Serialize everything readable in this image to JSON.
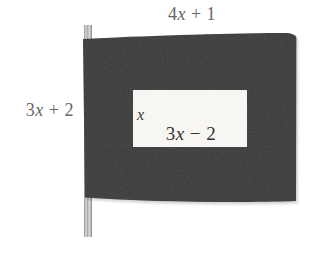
{
  "diagram": {
    "name": "flag-with-dimension-labels",
    "outer": {
      "width_label": {
        "coef": "4",
        "var": "x",
        "rest": " + 1"
      },
      "height_label": {
        "coef": "3",
        "var": "x",
        "rest": " + 2"
      }
    },
    "inner": {
      "height_label": {
        "var": "x"
      },
      "width_label": {
        "coef": "3",
        "var": "x",
        "rest": " − 2"
      }
    },
    "colors": {
      "flag_fabric": "#4d4d4d",
      "flag_fabric_perceived": "#3d3d3d",
      "inner_rectangle": "#f7f6f2",
      "pole_light": "#d6d6d6",
      "pole_dark": "#8e8e8e",
      "outer_label_text": "#666666",
      "inner_label_text": "#333333",
      "background": "#ffffff"
    }
  }
}
